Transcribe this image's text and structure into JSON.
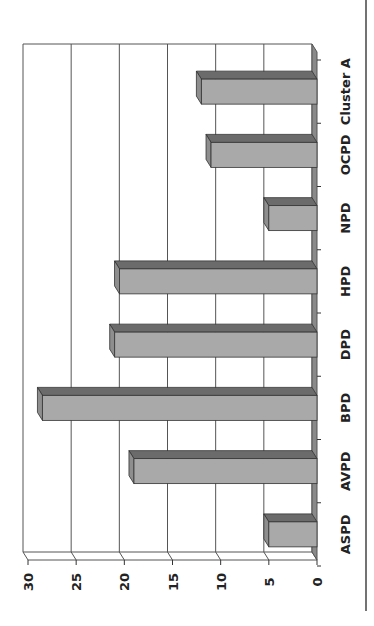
{
  "chart_data": {
    "type": "bar",
    "orientation": "vertical bars, image rotated 90° clockwise",
    "title": "",
    "xlabel": "",
    "ylabel": "",
    "categories": [
      "ASPD",
      "AVPD",
      "BPD",
      "DPD",
      "HPD",
      "NPD",
      "OCPD",
      "Cluster A"
    ],
    "values": [
      5,
      19,
      28.5,
      21,
      20.5,
      5,
      11,
      12
    ],
    "ylim": [
      0,
      30
    ],
    "yticks": [
      "0",
      "5",
      "10",
      "15",
      "20",
      "25",
      "30"
    ],
    "grid": true,
    "legend": null,
    "style": "3D bars, grey"
  },
  "colors": {
    "bar_front": "#a9a9a9",
    "bar_top": "#6b6b6b",
    "bar_side": "#8e8e8e",
    "grid": "#555555",
    "frame_line": "#444444"
  }
}
